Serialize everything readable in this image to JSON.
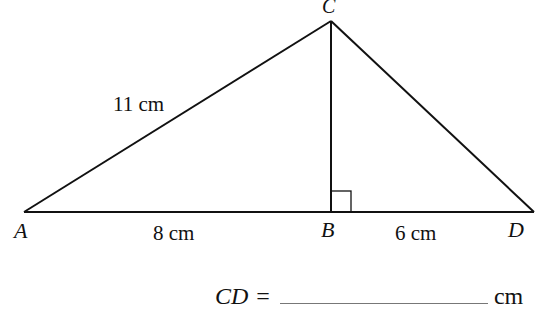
{
  "diagram": {
    "points": {
      "A": {
        "label": "A",
        "x": 24,
        "y": 212
      },
      "B": {
        "label": "B",
        "x": 331,
        "y": 212
      },
      "C": {
        "label": "C",
        "x": 331,
        "y": 21
      },
      "D": {
        "label": "D",
        "x": 534,
        "y": 212
      }
    },
    "segments": [
      {
        "from": "A",
        "to": "C",
        "label": "11cm"
      },
      {
        "from": "A",
        "to": "B",
        "label": "8cm"
      },
      {
        "from": "B",
        "to": "D",
        "label": "6cm"
      },
      {
        "from": "C",
        "to": "B",
        "label": ""
      },
      {
        "from": "C",
        "to": "D",
        "label": ""
      }
    ],
    "right_angle_at": "B",
    "labels": {
      "AC": "11 cm",
      "AB": "8 cm",
      "BD": "6 cm"
    }
  },
  "answer": {
    "prefix": "CD",
    "equals": "=",
    "unit": "cm",
    "value": ""
  }
}
